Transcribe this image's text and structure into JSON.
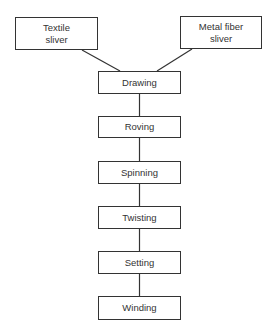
{
  "diagram": {
    "type": "process flowchart",
    "inputs": [
      {
        "id": "textile",
        "label": "Textile\nsliver"
      },
      {
        "id": "metal",
        "label": "Metal fiber\nsliver"
      }
    ],
    "steps": [
      {
        "id": "drawing",
        "label": "Drawing"
      },
      {
        "id": "roving",
        "label": "Roving"
      },
      {
        "id": "spinning",
        "label": "Spinning"
      },
      {
        "id": "twisting",
        "label": "Twisting"
      },
      {
        "id": "setting",
        "label": "Setting"
      },
      {
        "id": "winding",
        "label": "Winding"
      }
    ],
    "edges": [
      [
        "textile",
        "drawing"
      ],
      [
        "metal",
        "drawing"
      ],
      [
        "drawing",
        "roving"
      ],
      [
        "roving",
        "spinning"
      ],
      [
        "spinning",
        "twisting"
      ],
      [
        "twisting",
        "setting"
      ],
      [
        "setting",
        "winding"
      ]
    ],
    "colors": {
      "line": "#333333",
      "background": "#ffffff"
    }
  }
}
